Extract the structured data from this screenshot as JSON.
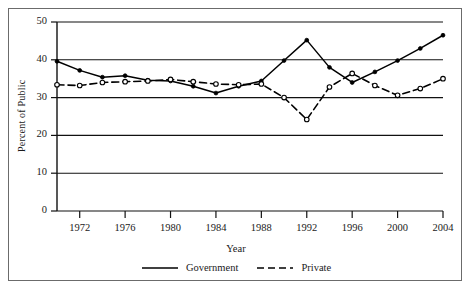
{
  "chart_data": {
    "type": "line",
    "title": "",
    "xlabel": "Year",
    "ylabel": "Percent of Public",
    "xlim": [
      1970,
      2004
    ],
    "ylim": [
      0,
      50
    ],
    "grid": true,
    "legend_position": "bottom",
    "x": [
      1970,
      1972,
      1974,
      1976,
      1978,
      1980,
      1982,
      1984,
      1986,
      1988,
      1990,
      1992,
      1994,
      1996,
      1998,
      2000,
      2002,
      2004
    ],
    "xtick_labels": [
      "1972",
      "1976",
      "1980",
      "1984",
      "1988",
      "1992",
      "1996",
      "2000",
      "2004"
    ],
    "xtick_values": [
      1972,
      1976,
      1980,
      1984,
      1988,
      1992,
      1996,
      2000,
      2004
    ],
    "ytick_labels": [
      "0",
      "10",
      "20",
      "30",
      "40",
      "50"
    ],
    "ytick_values": [
      0,
      10,
      20,
      30,
      40,
      50
    ],
    "series": [
      {
        "name": "Government",
        "style": "solid",
        "marker": "filled-circle",
        "color": "#000000",
        "values": [
          39.6,
          37.2,
          35.4,
          35.8,
          34.6,
          34.4,
          33.0,
          31.2,
          33.0,
          34.4,
          39.8,
          45.2,
          38.0,
          34.0,
          36.8,
          39.8,
          43.0,
          46.5
        ]
      },
      {
        "name": "Private",
        "style": "dashed",
        "marker": "open-circle",
        "color": "#000000",
        "values": [
          33.4,
          33.2,
          34.0,
          34.2,
          34.4,
          34.8,
          34.2,
          33.6,
          33.4,
          33.6,
          30.0,
          24.2,
          32.8,
          36.4,
          33.2,
          30.6,
          32.4,
          35.0
        ]
      }
    ]
  },
  "legend": {
    "items": [
      {
        "label": "Government",
        "style": "solid"
      },
      {
        "label": "Private",
        "style": "dashed"
      }
    ]
  }
}
